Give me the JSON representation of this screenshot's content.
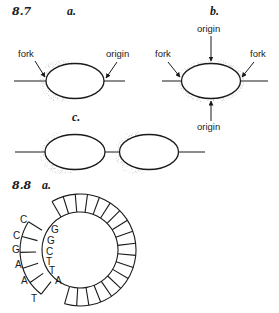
{
  "figure_8_7": {
    "number": "8.7",
    "panel_a": {
      "label": "a.",
      "fork_label": "fork",
      "origin_label": "origin"
    },
    "panel_b": {
      "label": "b.",
      "top_origin_label": "origin",
      "bottom_origin_label": "origin",
      "left_fork_label": "fork",
      "right_fork_label": "fork"
    },
    "panel_c": {
      "label": "c."
    }
  },
  "figure_8_8": {
    "number": "8.8",
    "panel_a": {
      "label": "a.",
      "outer_strand_bases": [
        "C",
        "C",
        "G",
        "A",
        "A",
        "T"
      ],
      "inner_strand_bases": [
        "G",
        "G",
        "C",
        "T",
        "T",
        "A"
      ],
      "ring": {
        "center": [
          80,
          250
        ],
        "outer_radius": 56,
        "inner_radius": 38,
        "main_arc_start_deg": -120,
        "main_arc_end_deg": 106,
        "main_cell_count": 18,
        "displaced_arc_start_deg": 128,
        "displaced_arc_end_deg": 212,
        "displaced_offset": 5,
        "displaced_cell_count": 5
      }
    }
  },
  "colors": {
    "ink": "#1a1a1a",
    "stipple": "#8a8a8a",
    "background": "#ffffff"
  }
}
